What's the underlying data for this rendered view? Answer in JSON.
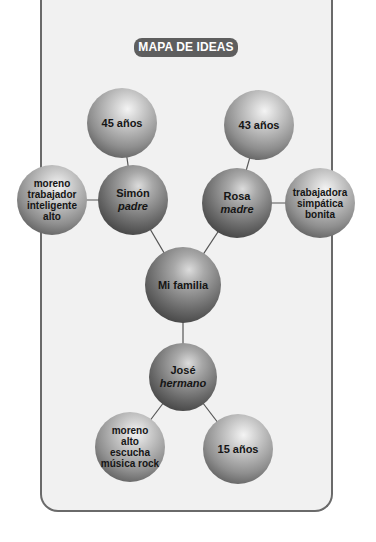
{
  "title": "MAPA DE IDEAS",
  "center": {
    "label": "Mi familia"
  },
  "nodes": {
    "simon": {
      "name": "Simón",
      "role": "padre"
    },
    "rosa": {
      "name": "Rosa",
      "role": "madre"
    },
    "jose": {
      "name": "José",
      "role": "hermano"
    },
    "simon_age": {
      "label": "45 años"
    },
    "rosa_age": {
      "label": "43 años"
    },
    "jose_age": {
      "label": "15 años"
    },
    "simon_traits": {
      "lines": [
        "moreno",
        "trabajador",
        "inteligente",
        "alto"
      ]
    },
    "rosa_traits": {
      "lines": [
        "trabajadora",
        "simpática",
        "bonita"
      ]
    },
    "jose_traits": {
      "lines": [
        "moreno",
        "alto",
        "escucha",
        "música rock"
      ]
    }
  },
  "colors": {
    "badge_bg": "#5e5e5e",
    "panel_bg": "#f1f1f1",
    "border": "#6a6a6a",
    "link": "#555555"
  }
}
